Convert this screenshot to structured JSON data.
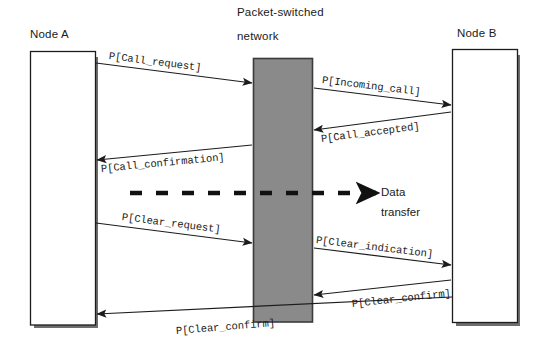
{
  "diagram": {
    "title_node_a": "Node A",
    "title_node_b": "Node B",
    "title_network_line1": "Packet-switched",
    "title_network_line2": "network",
    "data_transfer_line1": "Data",
    "data_transfer_line2": "transfer",
    "colors": {
      "background": "#ffffff",
      "stroke": "#1c1c1c",
      "network_fill": "#8a8a8a",
      "network_border": "#3b3b3b",
      "shadow": "#6e6e6e",
      "node_fill": "#ffffff",
      "text": "#1a1a1a"
    },
    "messages": [
      {
        "id": "call-request",
        "label": "P[Call_request]",
        "from": "Node A",
        "to": "network",
        "direction": "right"
      },
      {
        "id": "incoming-call",
        "label": "P[Incoming_call]",
        "from": "network",
        "to": "Node B",
        "direction": "right"
      },
      {
        "id": "call-accepted",
        "label": "P[Call_accepted]",
        "from": "Node B",
        "to": "network",
        "direction": "left"
      },
      {
        "id": "call-confirmation",
        "label": "P[Call_confirmation]",
        "from": "network",
        "to": "Node A",
        "direction": "left"
      },
      {
        "id": "clear-request",
        "label": "P[Clear_request]",
        "from": "Node A",
        "to": "network",
        "direction": "right"
      },
      {
        "id": "clear-indication",
        "label": "P[Clear_indication]",
        "from": "network",
        "to": "Node B",
        "direction": "right"
      },
      {
        "id": "clear-confirm-b",
        "label": "P[Clear_confirm]",
        "from": "Node B",
        "to": "network",
        "direction": "left"
      },
      {
        "id": "clear-confirm-a",
        "label": "P[Clear_confirm]",
        "from": "network",
        "to": "Node A",
        "direction": "left"
      }
    ]
  }
}
